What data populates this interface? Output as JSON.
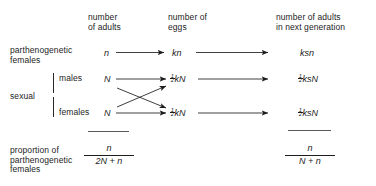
{
  "figure": {
    "type": "flow-diagram",
    "background_color": "#ffffff",
    "ink_color": "#1d1d1d",
    "columns": [
      {
        "id": "adults",
        "header": "number\nof adults"
      },
      {
        "id": "eggs",
        "header": "number of\neggs"
      },
      {
        "id": "nextgen",
        "header": "number of adults\nin next generation"
      }
    ],
    "rows": [
      {
        "id": "parthenogenetic",
        "label": "parthenogenetic\nfemales",
        "adults": "n",
        "eggs": "kn",
        "nextgen": "ksn"
      },
      {
        "id": "sexual-males",
        "group_label": "sexual",
        "sub_label": "males",
        "adults": "N",
        "eggs_prefix": "1/2",
        "eggs": "kN",
        "nextgen_prefix": "1/2",
        "nextgen": "ksN"
      },
      {
        "id": "sexual-females",
        "group_label": "sexual",
        "sub_label": "females",
        "adults": "N",
        "eggs_prefix": "1/2",
        "eggs": "kN",
        "nextgen_prefix": "1/2",
        "nextgen": "ksN"
      }
    ],
    "summary": {
      "label": "proportion of\nparthenogenetic\nfemales",
      "left_fraction": {
        "numerator": "n",
        "denominator": "2N + n"
      },
      "right_fraction": {
        "numerator": "n",
        "denominator": "N + n"
      }
    },
    "fraction_half": {
      "numerator": "1",
      "denominator": "2"
    },
    "arrows": {
      "straight_count": 6,
      "crossing_count": 2,
      "description": "horizontal arrows link adults to eggs and eggs to next generation; two diagonal arrows cross between the sexual males and females rows"
    }
  }
}
